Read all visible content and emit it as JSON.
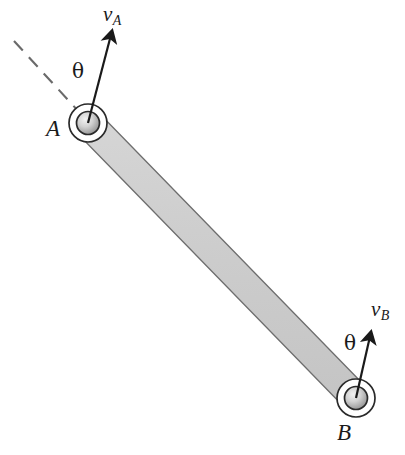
{
  "figure": {
    "background_color": "#ffffff",
    "stroke_color": "#1a1a1a",
    "bar": {
      "fill_color": "#cfcfcf",
      "edge_color": "#5a5a5a",
      "name": "rigid-bar-AB"
    },
    "pins": {
      "outer_ring_fill": "#ffffff",
      "outer_ring_stroke": "#2a2a2a",
      "hub_fill_light": "#e8e8e8",
      "hub_fill_dark": "#9a9a9a",
      "hub_stroke": "#2a2a2a"
    },
    "reference_line": {
      "style": "dashed",
      "color": "#6a6a6a",
      "name": "reference-axis-dashed"
    }
  },
  "labels": {
    "point_a": "A",
    "point_b": "B",
    "velocity_a": "v",
    "velocity_a_sub": "A",
    "velocity_b": "v",
    "velocity_b_sub": "B",
    "theta_a": "θ",
    "theta_b": "θ"
  },
  "geometry": {
    "pin_a_center": [
      88,
      123
    ],
    "pin_b_center": [
      356,
      398
    ],
    "pin_outer_radius": 19,
    "pin_hub_radius": 11.5,
    "bar_half_width": 14,
    "arrow_a_start": [
      88,
      123
    ],
    "arrow_a_tip": [
      113,
      27
    ],
    "arrow_b_start": [
      356,
      398
    ],
    "arrow_b_tip": [
      372,
      328
    ],
    "dashed_start": [
      14,
      41
    ],
    "dashed_end": [
      80,
      113
    ]
  }
}
